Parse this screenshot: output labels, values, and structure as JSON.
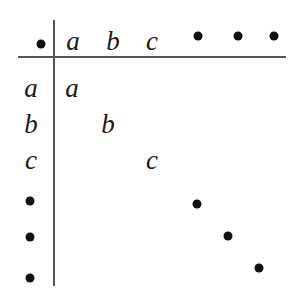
{
  "table": {
    "operation_symbol": "dot",
    "column_headers": [
      {
        "type": "text",
        "label": "a",
        "x": 73,
        "y": 41
      },
      {
        "type": "text",
        "label": "b",
        "x": 113,
        "y": 41
      },
      {
        "type": "text",
        "label": "c",
        "x": 152,
        "y": 41
      },
      {
        "type": "dot",
        "x": 198,
        "y": 36
      },
      {
        "type": "dot",
        "x": 238,
        "y": 36
      },
      {
        "type": "dot",
        "x": 274,
        "y": 36
      }
    ],
    "row_headers": [
      {
        "type": "text",
        "label": "a",
        "x": 31,
        "y": 88
      },
      {
        "type": "text",
        "label": "b",
        "x": 31,
        "y": 124
      },
      {
        "type": "text",
        "label": "c",
        "x": 31,
        "y": 160
      },
      {
        "type": "dot",
        "x": 30,
        "y": 201
      },
      {
        "type": "dot",
        "x": 30,
        "y": 237
      },
      {
        "type": "dot",
        "x": 30,
        "y": 278
      }
    ],
    "diagonal_entries": [
      {
        "type": "text",
        "label": "a",
        "x": 72,
        "y": 88
      },
      {
        "type": "text",
        "label": "b",
        "x": 108,
        "y": 124
      },
      {
        "type": "text",
        "label": "c",
        "x": 152,
        "y": 160
      },
      {
        "type": "dot",
        "x": 197,
        "y": 204
      },
      {
        "type": "dot",
        "x": 228,
        "y": 236
      },
      {
        "type": "dot",
        "x": 259,
        "y": 268
      }
    ],
    "corner": {
      "type": "dot",
      "x": 41,
      "y": 44
    }
  }
}
